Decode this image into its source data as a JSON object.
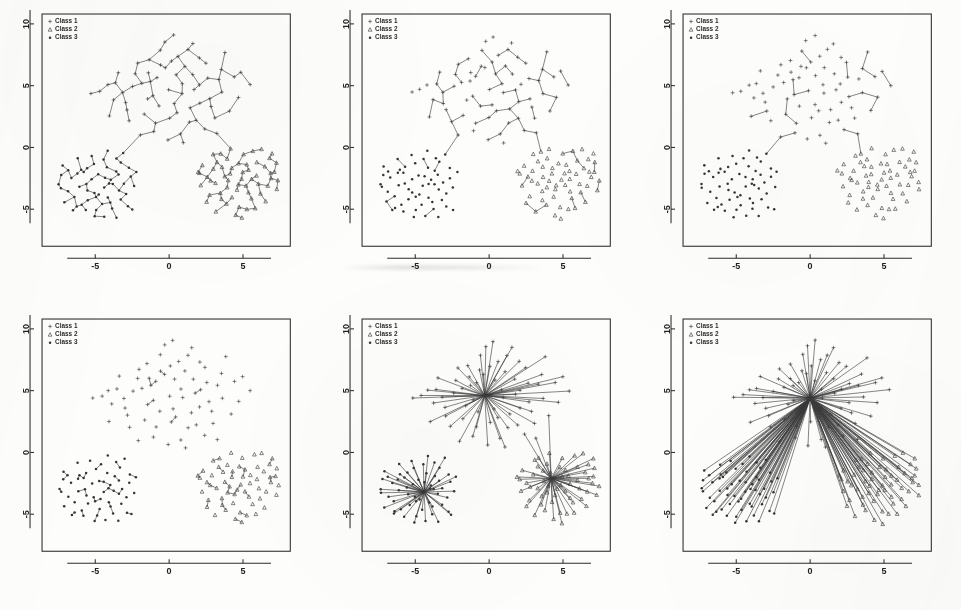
{
  "figure": {
    "panel_count": 6,
    "rows": 2,
    "cols": 3,
    "marker_color": "#343434",
    "edge_color": "#3a3a3a",
    "frame_color": "#2b2b2b",
    "background_color": "#fdfdfc"
  },
  "legend": {
    "entries": [
      {
        "label": "Class 1",
        "marker": "plus-marker"
      },
      {
        "label": "Class 2",
        "marker": "triangle-marker"
      },
      {
        "label": "Class 3",
        "marker": "circle-marker"
      }
    ]
  },
  "axes": {
    "x_ticks": [
      "-5",
      "0",
      "5"
    ],
    "x_tick_values": [
      -5,
      0,
      5
    ],
    "y_ticks": [
      "10",
      "5",
      "0",
      "-5"
    ],
    "y_tick_values": [
      10,
      5,
      0,
      -5
    ],
    "xlim": [
      -8.6,
      8.2
    ],
    "ylim": [
      -8.0,
      10.8
    ],
    "xlabel": "",
    "ylabel": "",
    "grid": false
  },
  "chart_data": {
    "type": "scatter",
    "xlabel": "",
    "ylabel": "",
    "xlim": [
      -8.6,
      8.2
    ],
    "ylim": [
      -8.0,
      10.8
    ],
    "grid": false,
    "legend_position": "top-left",
    "classes": [
      {
        "name": "Class 1",
        "marker": "plus",
        "cluster_center": [
          -0.3,
          4.6
        ]
      },
      {
        "name": "Class 2",
        "marker": "triangle",
        "cluster_center": [
          4.2,
          -2.1
        ]
      },
      {
        "name": "Class 3",
        "marker": "circle",
        "cluster_center": [
          -4.4,
          -3.2
        ]
      }
    ],
    "panels": [
      {
        "index": 1,
        "edge_mode": "full-spanning-tree",
        "edge_density": 1.0,
        "hubs": []
      },
      {
        "index": 2,
        "edge_mode": "pruned-tree",
        "edge_density": 0.34,
        "hubs": [
          [
            -0.3,
            4.6
          ],
          [
            4.2,
            -2.1
          ],
          [
            -4.4,
            -3.2
          ]
        ]
      },
      {
        "index": 3,
        "edge_mode": "triangle-skeleton",
        "edge_density": 0.09,
        "hubs": [
          [
            -0.3,
            4.6
          ],
          [
            4.2,
            -2.1
          ],
          [
            -4.4,
            -3.2
          ]
        ]
      },
      {
        "index": 4,
        "edge_mode": "local-fragments",
        "edge_density": 0.3,
        "hubs": []
      },
      {
        "index": 5,
        "edge_mode": "class-stars",
        "edge_density": 0.85,
        "hubs": [
          [
            -0.3,
            4.6
          ],
          [
            4.2,
            -2.1
          ],
          [
            -4.4,
            -3.2
          ]
        ]
      },
      {
        "index": 6,
        "edge_mode": "global-star",
        "edge_density": 1.0,
        "hubs": [
          [
            0.0,
            4.4
          ]
        ]
      }
    ],
    "points": {
      "class1": [
        [
          -0.31,
          6.39
        ],
        [
          0.12,
          6.92
        ],
        [
          -1.32,
          6.06
        ],
        [
          0.63,
          7.44
        ],
        [
          1.02,
          6.52
        ],
        [
          -0.84,
          5.71
        ],
        [
          0.41,
          5.88
        ],
        [
          -1.86,
          5.27
        ],
        [
          1.64,
          5.93
        ],
        [
          -0.05,
          4.61
        ],
        [
          0.92,
          4.38
        ],
        [
          -1.15,
          4.22
        ],
        [
          2.11,
          5.12
        ],
        [
          -2.42,
          4.88
        ],
        [
          0.28,
          3.51
        ],
        [
          1.43,
          3.12
        ],
        [
          -0.67,
          3.28
        ],
        [
          2.71,
          4.02
        ],
        [
          -3.12,
          4.45
        ],
        [
          0.06,
          2.42
        ],
        [
          1.92,
          2.28
        ],
        [
          -1.72,
          2.66
        ],
        [
          3.31,
          5.46
        ],
        [
          -2.05,
          6.77
        ],
        [
          2.42,
          6.88
        ],
        [
          -0.52,
          7.86
        ],
        [
          1.21,
          7.92
        ],
        [
          3.82,
          7.68
        ],
        [
          -3.58,
          5.18
        ],
        [
          -2.88,
          3.02
        ],
        [
          3.62,
          4.42
        ],
        [
          2.08,
          3.66
        ],
        [
          -1.02,
          1.26
        ],
        [
          0.71,
          1.06
        ],
        [
          4.42,
          5.72
        ],
        [
          -4.12,
          5.02
        ],
        [
          -0.22,
          8.62
        ],
        [
          2.88,
          3.28
        ],
        [
          -2.62,
          2.12
        ],
        [
          1.72,
          4.72
        ],
        [
          -1.52,
          3.86
        ],
        [
          0.52,
          2.88
        ],
        [
          3.02,
          2.42
        ],
        [
          -3.42,
          6.12
        ],
        [
          4.92,
          6.12
        ],
        [
          -4.62,
          4.62
        ],
        [
          1.02,
          0.38
        ],
        [
          2.32,
          1.42
        ],
        [
          -2.22,
          5.92
        ],
        [
          0.82,
          5.12
        ],
        [
          -0.92,
          2.02
        ],
        [
          3.52,
          6.32
        ],
        [
          -1.42,
          7.12
        ],
        [
          2.62,
          5.62
        ],
        [
          -3.02,
          3.62
        ],
        [
          5.42,
          5.02
        ],
        [
          -5.22,
          4.42
        ],
        [
          1.52,
          8.42
        ],
        [
          -0.12,
          0.62
        ],
        [
          4.12,
          3.02
        ],
        [
          -2.02,
          0.92
        ],
        [
          3.22,
          1.12
        ],
        [
          -4.02,
          2.52
        ],
        [
          0.32,
          9.02
        ],
        [
          2.02,
          7.32
        ],
        [
          -1.22,
          5.42
        ],
        [
          1.32,
          2.02
        ],
        [
          -0.62,
          6.62
        ],
        [
          4.62,
          4.12
        ],
        [
          -3.82,
          3.92
        ]
      ],
      "class2": [
        [
          4.18,
          -2.08
        ],
        [
          3.62,
          -1.52
        ],
        [
          4.92,
          -2.62
        ],
        [
          5.42,
          -1.88
        ],
        [
          3.22,
          -2.92
        ],
        [
          4.52,
          -3.42
        ],
        [
          5.92,
          -2.22
        ],
        [
          3.92,
          -0.92
        ],
        [
          6.42,
          -1.62
        ],
        [
          4.32,
          -4.02
        ],
        [
          2.92,
          -1.82
        ],
        [
          5.12,
          -3.12
        ],
        [
          6.12,
          -2.92
        ],
        [
          3.52,
          -3.62
        ],
        [
          4.72,
          -1.22
        ],
        [
          5.62,
          -4.12
        ],
        [
          2.62,
          -2.42
        ],
        [
          6.72,
          -0.92
        ],
        [
          3.82,
          -4.62
        ],
        [
          5.02,
          -0.52
        ],
        [
          4.02,
          -2.72
        ],
        [
          6.92,
          -2.42
        ],
        [
          2.32,
          -1.42
        ],
        [
          5.32,
          -5.02
        ],
        [
          4.42,
          -5.42
        ],
        [
          3.12,
          -5.12
        ],
        [
          7.12,
          -1.92
        ],
        [
          6.22,
          -3.72
        ],
        [
          2.12,
          -2.12
        ],
        [
          5.72,
          -0.22
        ],
        [
          3.42,
          -0.42
        ],
        [
          6.52,
          -4.42
        ],
        [
          4.12,
          -0.12
        ],
        [
          7.42,
          -2.72
        ],
        [
          2.72,
          -3.92
        ],
        [
          5.52,
          -2.52
        ],
        [
          3.72,
          -2.32
        ],
        [
          6.02,
          -1.12
        ],
        [
          4.82,
          -4.82
        ],
        [
          1.92,
          -1.92
        ],
        [
          7.02,
          -0.42
        ],
        [
          5.22,
          -1.42
        ],
        [
          3.32,
          -1.12
        ],
        [
          6.62,
          -3.12
        ],
        [
          4.62,
          -3.02
        ],
        [
          2.52,
          -4.42
        ],
        [
          5.82,
          -4.92
        ],
        [
          7.32,
          -3.42
        ],
        [
          3.02,
          -0.62
        ],
        [
          4.92,
          -5.72
        ],
        [
          6.32,
          -0.12
        ],
        [
          2.22,
          -3.12
        ],
        [
          5.02,
          -2.02
        ],
        [
          3.92,
          -3.22
        ],
        [
          7.22,
          -1.22
        ],
        [
          6.82,
          -2.02
        ],
        [
          4.22,
          -1.62
        ],
        [
          5.42,
          -3.62
        ],
        [
          3.52,
          -4.22
        ],
        [
          2.82,
          -2.72
        ]
      ],
      "class3": [
        [
          -4.42,
          -3.18
        ],
        [
          -3.92,
          -2.62
        ],
        [
          -5.12,
          -3.62
        ],
        [
          -4.82,
          -2.22
        ],
        [
          -3.42,
          -3.42
        ],
        [
          -5.62,
          -2.92
        ],
        [
          -4.12,
          -4.12
        ],
        [
          -3.12,
          -2.92
        ],
        [
          -6.12,
          -3.12
        ],
        [
          -4.62,
          -4.62
        ],
        [
          -5.42,
          -4.22
        ],
        [
          -3.62,
          -1.92
        ],
        [
          -6.62,
          -2.42
        ],
        [
          -4.22,
          -1.62
        ],
        [
          -5.02,
          -1.32
        ],
        [
          -3.22,
          -4.22
        ],
        [
          -7.12,
          -1.52
        ],
        [
          -5.92,
          -4.62
        ],
        [
          -4.92,
          -5.12
        ],
        [
          -2.92,
          -3.72
        ],
        [
          -6.42,
          -4.02
        ],
        [
          -3.82,
          -5.02
        ],
        [
          -7.42,
          -2.92
        ],
        [
          -5.22,
          -2.52
        ],
        [
          -4.02,
          -2.92
        ],
        [
          -6.02,
          -1.82
        ],
        [
          -2.62,
          -2.42
        ],
        [
          -5.72,
          -5.12
        ],
        [
          -3.52,
          -5.62
        ],
        [
          -4.52,
          -0.92
        ],
        [
          -6.82,
          -3.62
        ],
        [
          -2.42,
          -3.22
        ],
        [
          -5.32,
          -0.62
        ],
        [
          -3.32,
          -1.22
        ],
        [
          -7.02,
          -4.42
        ],
        [
          -4.72,
          -3.82
        ],
        [
          -6.22,
          -2.12
        ],
        [
          -2.82,
          -4.82
        ],
        [
          -5.52,
          -3.42
        ],
        [
          -3.02,
          -0.52
        ],
        [
          -6.52,
          -5.02
        ],
        [
          -4.32,
          -5.52
        ],
        [
          -2.22,
          -2.02
        ],
        [
          -7.22,
          -2.22
        ],
        [
          -5.82,
          -2.02
        ],
        [
          -3.72,
          -3.02
        ],
        [
          -6.32,
          -4.82
        ],
        [
          -4.12,
          -0.32
        ],
        [
          -2.52,
          -5.02
        ],
        [
          -5.62,
          -1.62
        ],
        [
          -3.42,
          -2.22
        ],
        [
          -6.92,
          -1.92
        ],
        [
          -4.92,
          -4.02
        ],
        [
          -2.72,
          -1.72
        ],
        [
          -5.12,
          -5.62
        ],
        [
          -3.92,
          -4.42
        ],
        [
          -7.32,
          -3.22
        ],
        [
          -6.12,
          -0.92
        ],
        [
          -4.42,
          -2.42
        ],
        [
          -3.62,
          -0.82
        ]
      ]
    }
  }
}
